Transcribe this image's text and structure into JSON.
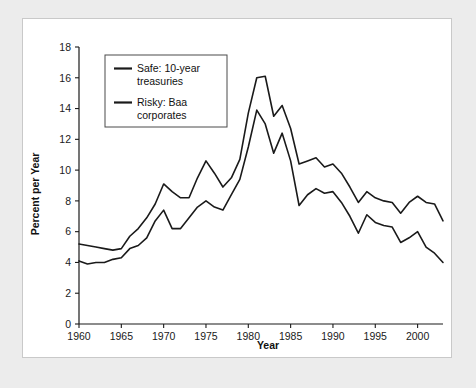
{
  "chart_data": {
    "type": "line",
    "title": "",
    "xlabel": "Year",
    "ylabel": "Percent per Year",
    "xlim": [
      1960,
      2003
    ],
    "ylim": [
      0,
      18
    ],
    "xticks": [
      1960,
      1965,
      1970,
      1975,
      1980,
      1985,
      1990,
      1995,
      2000
    ],
    "yticks": [
      0,
      2,
      4,
      6,
      8,
      10,
      12,
      14,
      16,
      18
    ],
    "grid": false,
    "legend_position": "top-left",
    "x": [
      1960,
      1961,
      1962,
      1963,
      1964,
      1965,
      1966,
      1967,
      1968,
      1969,
      1970,
      1971,
      1972,
      1973,
      1974,
      1975,
      1976,
      1977,
      1978,
      1979,
      1980,
      1981,
      1982,
      1983,
      1984,
      1985,
      1986,
      1987,
      1988,
      1989,
      1990,
      1991,
      1992,
      1993,
      1994,
      1995,
      1996,
      1997,
      1998,
      1999,
      2000,
      2001,
      2002,
      2003
    ],
    "series": [
      {
        "name": "Safe: 10-year treasuries",
        "color": "#1a1a1a",
        "values": [
          4.1,
          3.9,
          4.0,
          4.0,
          4.2,
          4.3,
          4.9,
          5.1,
          5.6,
          6.7,
          7.4,
          6.2,
          6.2,
          6.9,
          7.6,
          8.0,
          7.6,
          7.4,
          8.4,
          9.4,
          11.5,
          13.9,
          13.0,
          11.1,
          12.4,
          10.6,
          7.7,
          8.4,
          8.8,
          8.5,
          8.6,
          7.9,
          7.0,
          5.9,
          7.1,
          6.6,
          6.4,
          6.3,
          5.3,
          5.6,
          6.0,
          5.0,
          4.6,
          4.0
        ]
      },
      {
        "name": "Risky: Baa corporates",
        "color": "#1a1a1a",
        "values": [
          5.2,
          5.1,
          5.0,
          4.9,
          4.8,
          4.9,
          5.7,
          6.2,
          6.9,
          7.8,
          9.1,
          8.6,
          8.2,
          8.2,
          9.5,
          10.6,
          9.8,
          8.9,
          9.5,
          10.7,
          13.7,
          16.0,
          16.1,
          13.5,
          14.2,
          12.7,
          10.4,
          10.6,
          10.8,
          10.2,
          10.4,
          9.8,
          8.9,
          7.9,
          8.6,
          8.2,
          8.0,
          7.9,
          7.2,
          7.9,
          8.3,
          7.9,
          7.8,
          6.7
        ]
      }
    ],
    "legend": [
      {
        "label_line1": "Safe: 10-year",
        "label_line2": "treasuries"
      },
      {
        "label_line1": "Risky: Baa",
        "label_line2": "corporates"
      }
    ]
  },
  "figure": {
    "background_color": "#ffffff",
    "mat_color": "#ececec",
    "line_color": "#1a1a1a",
    "border_color": "#c9c9c9"
  }
}
